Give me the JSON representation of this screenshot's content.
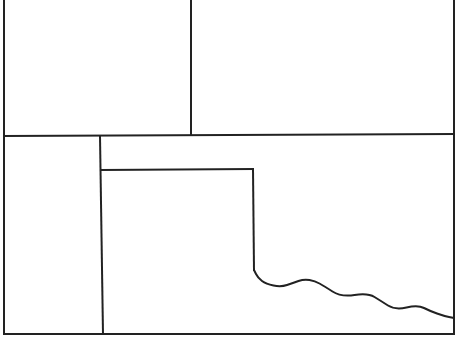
{
  "diagram": {
    "type": "line-drawing-partition",
    "width": 458,
    "height": 338,
    "background": "#ffffff",
    "stroke_color": "#222222",
    "stroke_width": 2,
    "lines": [
      {
        "name": "outer-left-edge",
        "x1": 4,
        "y1": 0,
        "x2": 4,
        "y2": 334
      },
      {
        "name": "outer-right-edge",
        "x1": 454,
        "y1": 0,
        "x2": 454,
        "y2": 334
      },
      {
        "name": "outer-bottom-edge",
        "x1": 4,
        "y1": 334,
        "x2": 454,
        "y2": 334
      },
      {
        "name": "middle-horizontal-divider",
        "x1": 4,
        "y1": 136,
        "x2": 454,
        "y2": 134
      },
      {
        "name": "upper-vertical-divider",
        "x1": 191,
        "y1": 0,
        "x2": 191,
        "y2": 135
      },
      {
        "name": "lower-left-vertical-divider",
        "x1": 100,
        "y1": 136,
        "x2": 103,
        "y2": 334
      },
      {
        "name": "inner-box-top",
        "x1": 101,
        "y1": 170,
        "x2": 253,
        "y2": 169
      },
      {
        "name": "inner-box-right",
        "x1": 253,
        "y1": 169,
        "x2": 254,
        "y2": 270
      }
    ],
    "wavy_boundary": {
      "name": "wavy-boundary",
      "points": [
        [
          254,
          270
        ],
        [
          258,
          278
        ],
        [
          266,
          284
        ],
        [
          281,
          287
        ],
        [
          293,
          283
        ],
        [
          304,
          279
        ],
        [
          315,
          281
        ],
        [
          324,
          286
        ],
        [
          341,
          297
        ],
        [
          368,
          293
        ],
        [
          381,
          301
        ],
        [
          395,
          310
        ],
        [
          418,
          305
        ],
        [
          430,
          311
        ],
        [
          444,
          316
        ],
        [
          454,
          318
        ]
      ]
    }
  }
}
